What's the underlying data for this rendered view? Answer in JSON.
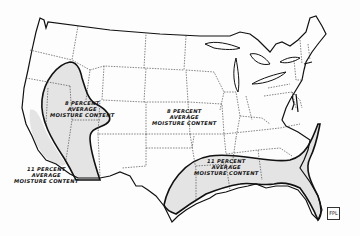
{
  "map": {
    "subject": "Average moisture content regions, United States",
    "colors": {
      "background": "#fdfdfd",
      "outline": "#111111",
      "state_border": "#333333",
      "zone_fill": "#e4e4e4"
    },
    "zones": [
      {
        "id": "west-8",
        "lines": [
          "8 PERCENT",
          "AVERAGE",
          "MOISTURE CONTENT"
        ]
      },
      {
        "id": "central-8",
        "lines": [
          "8 PERCENT",
          "AVERAGE",
          "MOISTURE CONTENT"
        ]
      },
      {
        "id": "southeast-11",
        "lines": [
          "11 PERCENT",
          "AVERAGE",
          "MOISTURE CONTENT"
        ]
      },
      {
        "id": "pacific-11",
        "lines": [
          "11 PERCENT",
          "AVERAGE",
          "MOISTURE CONTENT"
        ]
      }
    ],
    "stamp": "FPL"
  }
}
